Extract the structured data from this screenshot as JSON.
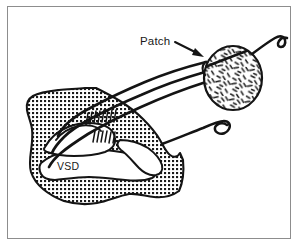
{
  "figure": {
    "type": "line-drawing",
    "frame": {
      "border_color": "#8d8d8d",
      "background_color": "#ffffff",
      "x": 7,
      "y": 6,
      "width": 284,
      "height": 233
    },
    "ink_color": "#141414",
    "labels": [
      {
        "id": "patch",
        "text": "Patch",
        "x": 140,
        "y": 45,
        "font_size": 11.5,
        "has_leader_arrow": true,
        "arrow_from": [
          175,
          43
        ],
        "arrow_to": [
          203,
          57
        ]
      },
      {
        "id": "vsd",
        "text": "VSD",
        "x": 57,
        "y": 166,
        "font_size": 10.5,
        "has_leader_arrow": false
      }
    ],
    "structures": [
      {
        "id": "myocardium",
        "name": "septal-myocardium-tissue",
        "fill_pattern": "cross-hatch-dots",
        "pattern_color": "#1a1a1a",
        "outline_color": "#141414",
        "outline_width": 2.0
      },
      {
        "id": "patch-graft",
        "name": "circular-patch-graft",
        "shape": "ellipse",
        "center": [
          233,
          78
        ],
        "radius_x": 29,
        "radius_y": 32,
        "fill_pattern": "short-dashes",
        "outline_color": "#141414",
        "outline_width": 2.2
      },
      {
        "id": "vsd-opening",
        "name": "vsd-defect-opening",
        "fill": "#ffffff",
        "outline_color": "#141414"
      },
      {
        "id": "suture-bundle",
        "name": "suture-strands",
        "count": 3,
        "color": "#141414",
        "width": 2.6
      },
      {
        "id": "suture-tails",
        "name": "curled-suture-tails",
        "count": 2,
        "color": "#141414"
      },
      {
        "id": "stitch-rungs",
        "name": "stitch-rung-marks",
        "color": "#141414"
      }
    ]
  }
}
